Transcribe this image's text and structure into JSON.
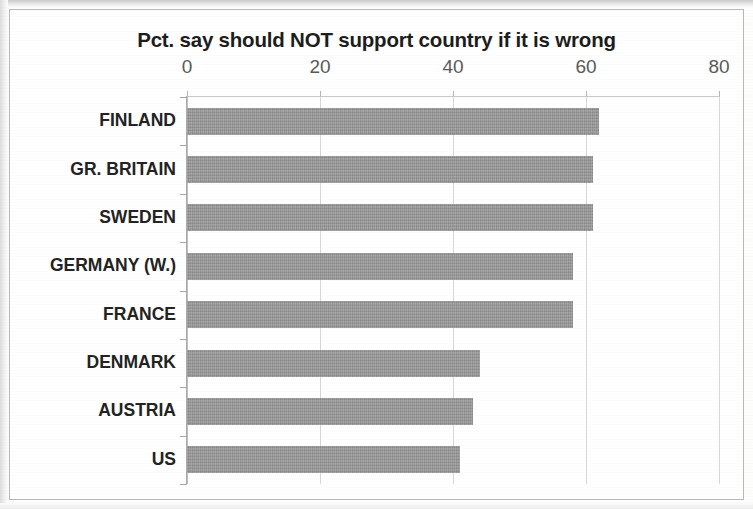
{
  "chart_data": {
    "type": "bar",
    "orientation": "horizontal",
    "title": "Pct. say should NOT support country if it is wrong",
    "xlabel": "",
    "ylabel": "",
    "xlim": [
      0,
      80
    ],
    "xticks": [
      0,
      20,
      40,
      60,
      80
    ],
    "xtick_labels": [
      "0",
      "20",
      "40",
      "60",
      "80"
    ],
    "grid": true,
    "grid_axis": "x",
    "legend": false,
    "bar_color": "#979797",
    "text_color": "#232323",
    "categories": [
      "FINLAND",
      "GR. BRITAIN",
      "SWEDEN",
      "GERMANY (W.)",
      "FRANCE",
      "DENMARK",
      "AUSTRIA",
      "US"
    ],
    "values": [
      62,
      61,
      61,
      58,
      58,
      44,
      43,
      41
    ]
  }
}
